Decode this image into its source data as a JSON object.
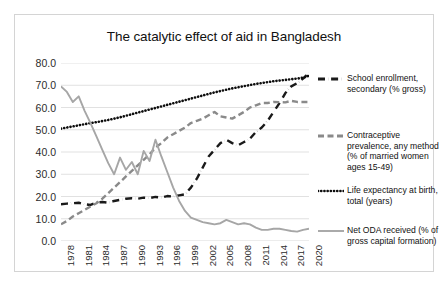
{
  "chart_data": {
    "type": "line",
    "title": "The catalytic effect of aid in Bangladesh",
    "xlabel": "",
    "ylabel": "",
    "ylim": [
      0.0,
      80.0
    ],
    "yticks": [
      "0.0",
      "10.0",
      "20.0",
      "30.0",
      "40.0",
      "50.0",
      "60.0",
      "70.0",
      "80.0"
    ],
    "grid": true,
    "legend_position": "right",
    "x_start": 1978,
    "x_end": 2020,
    "xticks": [
      "1978",
      "1981",
      "1984",
      "1987",
      "1990",
      "1993",
      "1996",
      "1999",
      "2002",
      "2005",
      "2008",
      "2011",
      "2014",
      "2017",
      "2020"
    ],
    "x": [
      1978,
      1979,
      1980,
      1981,
      1982,
      1983,
      1984,
      1985,
      1986,
      1987,
      1988,
      1989,
      1990,
      1991,
      1992,
      1993,
      1994,
      1995,
      1996,
      1997,
      1998,
      1999,
      2000,
      2001,
      2002,
      2003,
      2004,
      2005,
      2006,
      2007,
      2008,
      2009,
      2010,
      2011,
      2012,
      2013,
      2014,
      2015,
      2016,
      2017,
      2018,
      2019,
      2020
    ],
    "series": [
      {
        "name": "School enrollment, secondary (% gross)",
        "style": "dash-dot",
        "color": "#1a1a1a",
        "values": [
          16.5,
          16.8,
          17.0,
          17.2,
          16.5,
          16.2,
          17.3,
          17.5,
          17.2,
          18.0,
          18.5,
          19.0,
          19.2,
          19.0,
          19.5,
          19.3,
          19.8,
          19.5,
          20.2,
          20.0,
          20.5,
          21.0,
          24.0,
          28.0,
          33.0,
          38.0,
          41.0,
          44.0,
          45.5,
          44.0,
          43.0,
          44.5,
          46.0,
          49.0,
          51.0,
          54.0,
          58.0,
          62.0,
          66.5,
          69.5,
          71.0,
          73.0,
          75.5
        ]
      },
      {
        "name": "Contraceptive prevalence, any method (% of married women ages 15-49)",
        "style": "dashed",
        "color": "#8a8a8a",
        "values": [
          7.5,
          9.0,
          11.0,
          12.5,
          14.0,
          15.5,
          17.0,
          19.0,
          21.5,
          24.0,
          26.5,
          29.0,
          31.5,
          34.0,
          36.5,
          39.0,
          42.0,
          44.0,
          46.5,
          48.0,
          49.5,
          51.0,
          53.0,
          54.0,
          55.0,
          56.5,
          58.0,
          56.0,
          55.5,
          55.0,
          56.5,
          58.0,
          60.0,
          61.0,
          62.0,
          62.0,
          62.5,
          62.4,
          62.3,
          63.0,
          62.5,
          62.5,
          62.5
        ]
      },
      {
        "name": "Life expectancy at birth, total (years)",
        "style": "dotted",
        "color": "#0d0d0d",
        "values": [
          50.5,
          51.0,
          51.5,
          52.0,
          52.5,
          53.0,
          53.4,
          53.9,
          54.4,
          55.0,
          55.6,
          56.3,
          57.0,
          57.7,
          58.4,
          59.1,
          59.8,
          60.5,
          61.2,
          61.9,
          62.6,
          63.3,
          64.0,
          64.7,
          65.4,
          66.1,
          66.8,
          67.4,
          68.0,
          68.6,
          69.1,
          69.6,
          70.1,
          70.6,
          71.0,
          71.4,
          71.8,
          72.1,
          72.4,
          72.7,
          73.0,
          73.4,
          74.3
        ]
      },
      {
        "name": "Net ODA received (% of gross capital formation)",
        "style": "solid",
        "color": "#a6a6a6",
        "values": [
          69.5,
          67.0,
          62.5,
          65.0,
          58.5,
          53.0,
          47.0,
          41.0,
          35.0,
          30.0,
          37.5,
          32.0,
          35.5,
          30.0,
          40.5,
          36.0,
          45.5,
          38.0,
          31.0,
          24.0,
          18.0,
          13.5,
          10.5,
          9.5,
          8.5,
          8.0,
          7.5,
          8.0,
          9.5,
          8.5,
          7.5,
          8.0,
          7.5,
          6.0,
          5.0,
          5.0,
          5.5,
          5.5,
          5.0,
          4.5,
          4.2,
          5.0,
          5.5
        ]
      }
    ]
  },
  "legend": {
    "entries": [
      {
        "label": "School enrollment, secondary (% gross)",
        "marker": "dash-dot-marker",
        "color": "#1a1a1a"
      },
      {
        "label": "Contraceptive prevalence, any method (% of married women ages 15-49)",
        "marker": "dashed-marker",
        "color": "#8a8a8a"
      },
      {
        "label": "Life expectancy at birth, total (years)",
        "marker": "dotted-marker",
        "color": "#0d0d0d"
      },
      {
        "label": "Net ODA received (% of gross capital formation)",
        "marker": "solid-marker",
        "color": "#a6a6a6"
      }
    ]
  }
}
